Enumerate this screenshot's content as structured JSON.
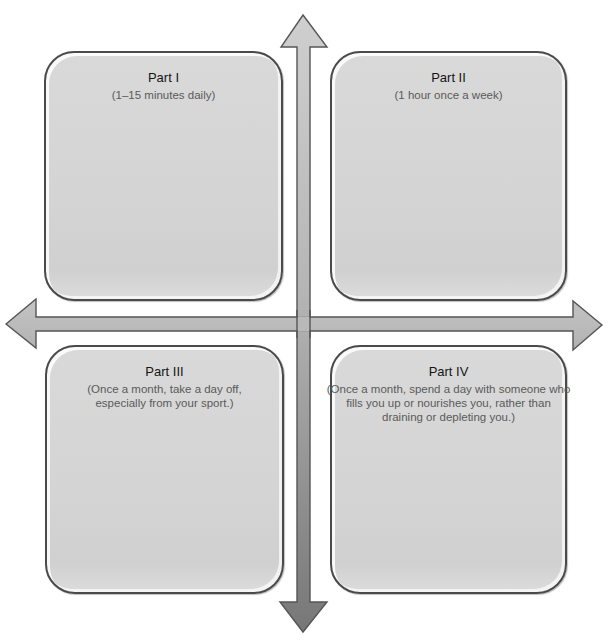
{
  "header": {
    "cutoff_title": "Types of renewal: Daily, Weekly, Monthly"
  },
  "quadrants": [
    {
      "title": "Part I",
      "subtitle": "(1–15 minutes daily)"
    },
    {
      "title": "Part II",
      "subtitle": "(1 hour once a week)"
    },
    {
      "title": "Part III",
      "subtitle": "(Once a month, take a day off, especially from your sport.)"
    },
    {
      "title": "Part IV",
      "subtitle": "(Once a month, spend a day with someone who fills you up or nourishes you, rather than draining or depleting you.)"
    }
  ],
  "arrows": {
    "horizontal": {
      "direction": "left-right",
      "fill": "#bdbdbd",
      "stroke": "#555555"
    },
    "vertical": {
      "direction": "up-down",
      "fill_top": "#cfcfcf",
      "fill_bottom": "#7a7a7a",
      "stroke": "#555555"
    }
  },
  "colors": {
    "box_fill": "#d6d6d6",
    "box_border": "#4a4a4a",
    "title_text": "#151515",
    "subtitle_text": "#5a5a5a"
  }
}
